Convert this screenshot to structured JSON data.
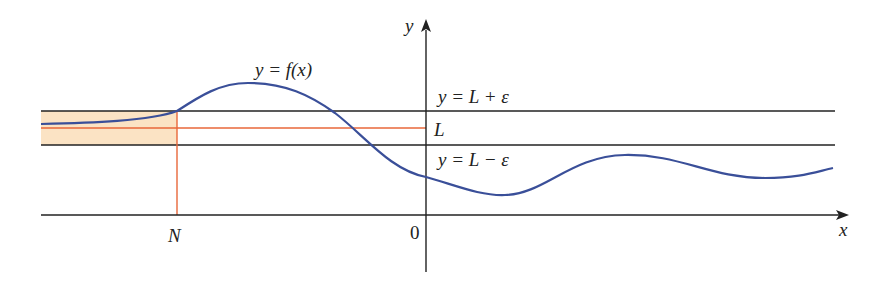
{
  "figure": {
    "colors": {
      "curve": "#3a4f99",
      "axes": "#222222",
      "bands": "#222222",
      "limit_line": "#e8673a",
      "n_line": "#e8673a",
      "shaded_region": "#fbe3c4"
    },
    "labels": {
      "curve": "y = f(x)",
      "upper_band": "y = L + ε",
      "limit": "L",
      "lower_band": "y = L − ε",
      "y_axis": "y",
      "x_axis": "x",
      "origin": "0",
      "n_marker": "N"
    }
  }
}
